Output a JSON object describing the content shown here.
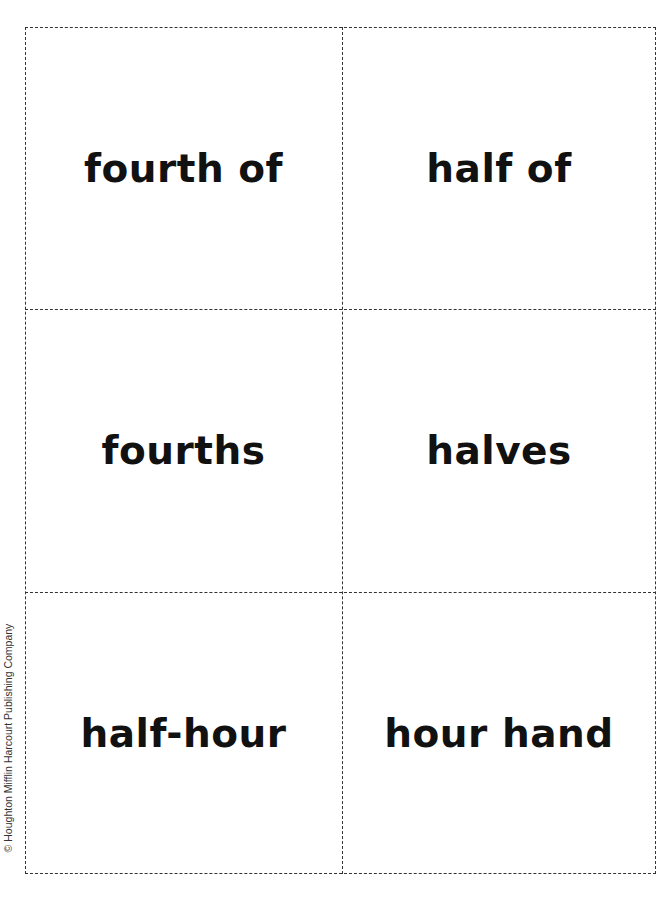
{
  "cards": [
    {
      "text": "fourth of"
    },
    {
      "text": "half of"
    },
    {
      "text": "fourths"
    },
    {
      "text": "halves"
    },
    {
      "text": "half-hour"
    },
    {
      "text": "hour hand"
    }
  ],
  "credit": "© Houghton Mifflin Harcourt Publishing Company"
}
